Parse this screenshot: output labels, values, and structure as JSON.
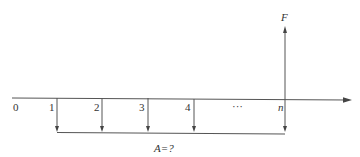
{
  "diagram": {
    "type": "cash-flow-timeline",
    "timeline": {
      "periods": [
        {
          "label": "0",
          "x": 15
        },
        {
          "label": "1",
          "x": 52
        },
        {
          "label": "2",
          "x": 97
        },
        {
          "label": "3",
          "x": 142
        },
        {
          "label": "4",
          "x": 188
        },
        {
          "label": "···",
          "x": 236
        },
        {
          "label": "n",
          "x": 280
        }
      ]
    },
    "future_value": {
      "label": "F",
      "direction": "up",
      "at_period": "n"
    },
    "annuity": {
      "label": "A=?",
      "direction": "down",
      "payment_periods": [
        "1",
        "2",
        "3",
        "4",
        "n"
      ]
    }
  }
}
